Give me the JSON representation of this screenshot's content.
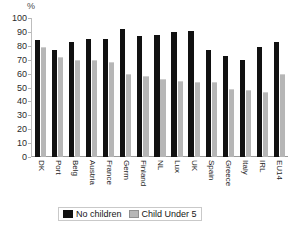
{
  "chart_data": {
    "type": "bar",
    "title": "",
    "subtitle": "",
    "xlabel": "",
    "ylabel": "%",
    "unit_label": "%",
    "ylim": [
      0,
      100
    ],
    "ytick_step": 10,
    "yticks": [
      "100",
      "90",
      "80",
      "70",
      "60",
      "50",
      "40",
      "30",
      "20",
      "10",
      "0"
    ],
    "grid": false,
    "legend_position": "bottom",
    "categories": [
      "DK",
      "Port",
      "Belg",
      "Austria",
      "France",
      "Germ",
      "Finland",
      "NL",
      "Lux",
      "UK",
      "Spain",
      "Greece",
      "Italy",
      "IRL",
      "EU14"
    ],
    "series": [
      {
        "name": "No children",
        "color": "#111111",
        "values": [
          84,
          77,
          83,
          85,
          85,
          92,
          87,
          88,
          90,
          91,
          77,
          73,
          70,
          79,
          83
        ]
      },
      {
        "name": "Child Under 5",
        "color": "#b6b6b6",
        "values": [
          79,
          72,
          70,
          70,
          68,
          60,
          58,
          56,
          55,
          54,
          54,
          49,
          48,
          47,
          60
        ]
      }
    ]
  },
  "legend": {
    "items": [
      {
        "label": "No children",
        "swatch": "dark"
      },
      {
        "label": "Child Under 5",
        "swatch": "light"
      }
    ]
  }
}
